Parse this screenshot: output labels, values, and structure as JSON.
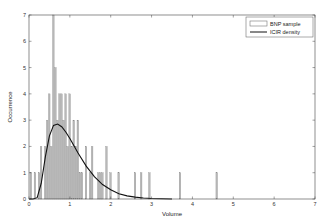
{
  "chart_data": {
    "type": "bar",
    "title": "",
    "xlabel": "Volume",
    "ylabel": "Occurrence",
    "xlim": [
      0,
      7
    ],
    "ylim": [
      0,
      7
    ],
    "xticks": [
      0,
      1,
      2,
      3,
      4,
      5,
      6,
      7
    ],
    "yticks": [
      0,
      1,
      2,
      3,
      4,
      5,
      6,
      7
    ],
    "grid": false,
    "legend_position": "upper right",
    "legend": [
      "BNP sample",
      "ICIR density"
    ],
    "series": [
      {
        "name": "BNP sample",
        "type": "histogram",
        "bin_width": 0.05,
        "bins": [
          {
            "x": 0.05,
            "count": 1
          },
          {
            "x": 0.15,
            "count": 1
          },
          {
            "x": 0.25,
            "count": 1
          },
          {
            "x": 0.3,
            "count": 2
          },
          {
            "x": 0.4,
            "count": 2
          },
          {
            "x": 0.45,
            "count": 3
          },
          {
            "x": 0.5,
            "count": 4
          },
          {
            "x": 0.55,
            "count": 2
          },
          {
            "x": 0.6,
            "count": 7
          },
          {
            "x": 0.65,
            "count": 5
          },
          {
            "x": 0.7,
            "count": 3
          },
          {
            "x": 0.75,
            "count": 4
          },
          {
            "x": 0.8,
            "count": 4
          },
          {
            "x": 0.85,
            "count": 3
          },
          {
            "x": 0.9,
            "count": 4
          },
          {
            "x": 0.95,
            "count": 2
          },
          {
            "x": 1.0,
            "count": 4
          },
          {
            "x": 1.05,
            "count": 2
          },
          {
            "x": 1.1,
            "count": 3
          },
          {
            "x": 1.15,
            "count": 2
          },
          {
            "x": 1.2,
            "count": 3
          },
          {
            "x": 1.25,
            "count": 1
          },
          {
            "x": 1.3,
            "count": 1
          },
          {
            "x": 1.4,
            "count": 2
          },
          {
            "x": 1.5,
            "count": 1
          },
          {
            "x": 1.55,
            "count": 2
          },
          {
            "x": 1.7,
            "count": 1
          },
          {
            "x": 1.75,
            "count": 1
          },
          {
            "x": 1.8,
            "count": 1
          },
          {
            "x": 1.9,
            "count": 2
          },
          {
            "x": 2.0,
            "count": 1
          },
          {
            "x": 2.2,
            "count": 1
          },
          {
            "x": 2.6,
            "count": 1
          },
          {
            "x": 2.75,
            "count": 1
          },
          {
            "x": 2.95,
            "count": 1
          },
          {
            "x": 3.7,
            "count": 1
          },
          {
            "x": 4.6,
            "count": 1
          }
        ]
      },
      {
        "name": "ICIR density",
        "type": "line",
        "x": [
          0.0,
          0.1,
          0.2,
          0.3,
          0.4,
          0.5,
          0.6,
          0.7,
          0.8,
          0.9,
          1.0,
          1.2,
          1.4,
          1.6,
          1.8,
          2.0,
          2.2,
          2.4,
          2.6,
          2.8,
          3.0,
          3.5
        ],
        "values": [
          0.0,
          0.0,
          0.05,
          0.6,
          1.6,
          2.4,
          2.8,
          2.85,
          2.75,
          2.55,
          2.3,
          1.75,
          1.25,
          0.85,
          0.55,
          0.35,
          0.2,
          0.12,
          0.07,
          0.04,
          0.02,
          0.0
        ]
      }
    ]
  },
  "labels": {
    "xlabel": "Volume",
    "ylabel": "Occurrence",
    "legend_bar": "BNP sample",
    "legend_line": "ICIR density"
  }
}
